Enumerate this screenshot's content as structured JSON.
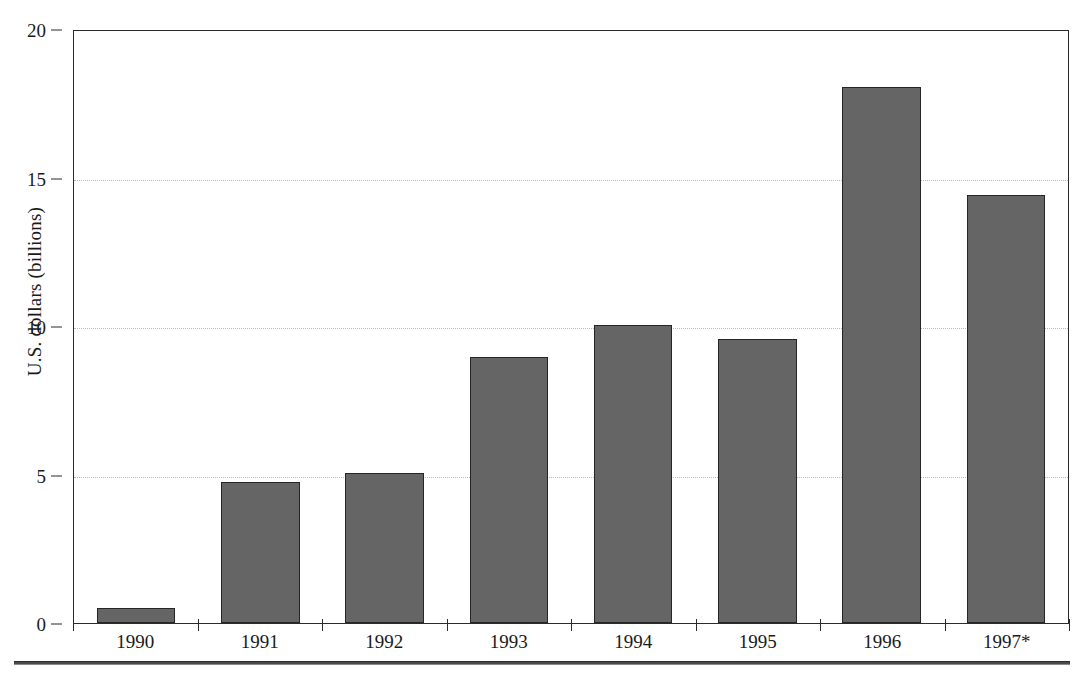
{
  "chart_data": {
    "type": "bar",
    "title": "",
    "subtitle": "",
    "xlabel": "",
    "ylabel": "U.S. dollars (billions)",
    "categories": [
      "1990",
      "1991",
      "1992",
      "1993",
      "1994",
      "1995",
      "1996",
      "1997*"
    ],
    "values": [
      0.5,
      4.75,
      5.05,
      8.95,
      10.05,
      9.55,
      18.05,
      14.4
    ],
    "ylim": [
      0,
      20
    ],
    "yticks": [
      0,
      5,
      10,
      15,
      20
    ],
    "ytick_labels": [
      "0",
      "5",
      "10",
      "15",
      "20"
    ],
    "grid": "horizontal-dotted",
    "legend": "none",
    "bar_color": "#656565",
    "bar_border_color": "#262626",
    "axis_color": "#2b2b2b",
    "gridline_color": "#b9b9b9",
    "background": "#ffffff",
    "annotations": [
      "* denotes projected or partial-year figure"
    ]
  },
  "footer": {
    "rule": "horizontal-rule"
  }
}
